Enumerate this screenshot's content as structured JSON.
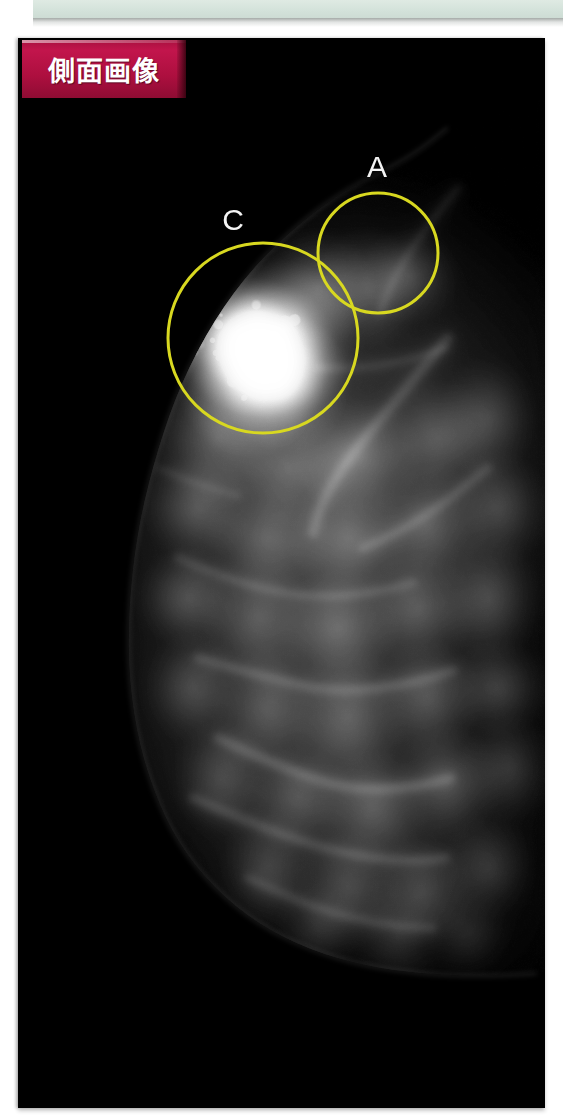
{
  "figure": {
    "modality": "mammogram",
    "background_color": "#000000",
    "panel_left": 18,
    "panel_top": 38,
    "panel_width": 527,
    "panel_height": 1070
  },
  "top_band": {
    "color": "#d3e2da",
    "name": "decorative-band"
  },
  "badge": {
    "label": "側面画像",
    "background_color": "#b01040",
    "text_color": "#ffffff"
  },
  "annotations": {
    "stroke_color": "#d8d820",
    "stroke_width": 3,
    "label_color": "#f4f4f4",
    "regions": [
      {
        "id": "A",
        "label": "A",
        "cx": 360,
        "cy": 215,
        "r": 60,
        "label_x": 359,
        "label_y": 129
      },
      {
        "id": "C",
        "label": "C",
        "cx": 245,
        "cy": 300,
        "r": 95,
        "label_x": 215,
        "label_y": 182
      }
    ]
  },
  "tissue": {
    "description": "fibroglandular breast tissue, lateral projection",
    "bright_mass": {
      "cx": 240,
      "cy": 310,
      "rx": 80,
      "ry": 70
    }
  }
}
